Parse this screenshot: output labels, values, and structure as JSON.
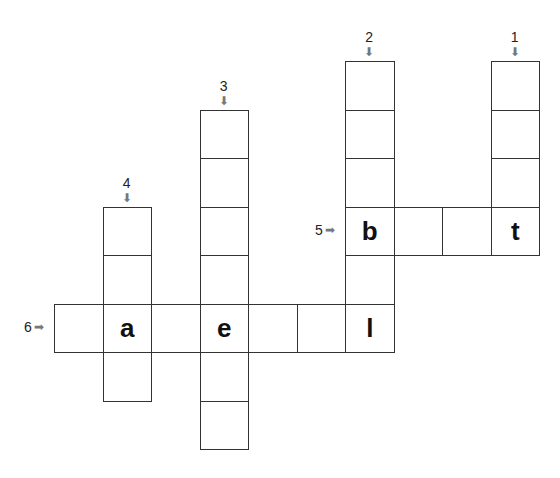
{
  "puzzle": {
    "cell_size": 48.5,
    "origin_x": 54,
    "origin_y": 61,
    "clues": [
      {
        "number": "1",
        "direction": "down",
        "col": 9,
        "row": 0,
        "length": 4
      },
      {
        "number": "2",
        "direction": "down",
        "col": 6,
        "row": 0,
        "length": 6
      },
      {
        "number": "3",
        "direction": "down",
        "col": 3,
        "row": 1,
        "length": 8
      },
      {
        "number": "4",
        "direction": "down",
        "col": 1,
        "row": 3,
        "length": 4
      },
      {
        "number": "5",
        "direction": "across",
        "col": 6,
        "row": 3,
        "length": 4
      },
      {
        "number": "6",
        "direction": "across",
        "col": 0,
        "row": 5,
        "length": 7
      }
    ],
    "cells": [
      {
        "col": 9,
        "row": 0,
        "letter": ""
      },
      {
        "col": 9,
        "row": 1,
        "letter": ""
      },
      {
        "col": 9,
        "row": 2,
        "letter": ""
      },
      {
        "col": 9,
        "row": 3,
        "letter": "t"
      },
      {
        "col": 6,
        "row": 0,
        "letter": ""
      },
      {
        "col": 6,
        "row": 1,
        "letter": ""
      },
      {
        "col": 6,
        "row": 2,
        "letter": ""
      },
      {
        "col": 6,
        "row": 3,
        "letter": "b"
      },
      {
        "col": 6,
        "row": 4,
        "letter": ""
      },
      {
        "col": 6,
        "row": 5,
        "letter": "l"
      },
      {
        "col": 7,
        "row": 3,
        "letter": ""
      },
      {
        "col": 8,
        "row": 3,
        "letter": ""
      },
      {
        "col": 3,
        "row": 1,
        "letter": ""
      },
      {
        "col": 3,
        "row": 2,
        "letter": ""
      },
      {
        "col": 3,
        "row": 3,
        "letter": ""
      },
      {
        "col": 3,
        "row": 4,
        "letter": ""
      },
      {
        "col": 3,
        "row": 5,
        "letter": "e"
      },
      {
        "col": 3,
        "row": 6,
        "letter": ""
      },
      {
        "col": 3,
        "row": 7,
        "letter": ""
      },
      {
        "col": 1,
        "row": 3,
        "letter": ""
      },
      {
        "col": 1,
        "row": 4,
        "letter": ""
      },
      {
        "col": 1,
        "row": 5,
        "letter": "a"
      },
      {
        "col": 1,
        "row": 6,
        "letter": ""
      },
      {
        "col": 0,
        "row": 5,
        "letter": ""
      },
      {
        "col": 2,
        "row": 5,
        "letter": ""
      },
      {
        "col": 4,
        "row": 5,
        "letter": ""
      },
      {
        "col": 5,
        "row": 5,
        "letter": ""
      }
    ]
  },
  "icons": {
    "down_arrow": "⬇",
    "right_arrow": "➡"
  }
}
